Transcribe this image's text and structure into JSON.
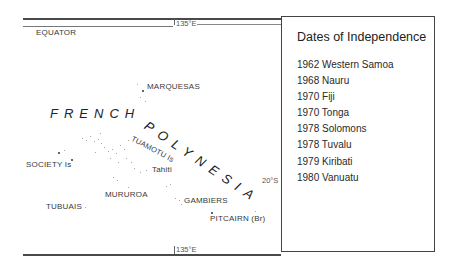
{
  "map": {
    "title": "French Polynesia and Pacific Island Independence",
    "grid_labels": {
      "meridian_top": "135°E",
      "meridian_bottom": "135°E",
      "equator": "EQUATOR",
      "latitude": "20°S"
    },
    "region_labels": {
      "french": "FRENCH",
      "polynesia": "POLYNESIA"
    },
    "place_labels": [
      {
        "name": "MARQUESAS",
        "x": 147,
        "y": 86
      },
      {
        "name": "TUAMOTU Is",
        "x": 134,
        "y": 134,
        "rotate": 28
      },
      {
        "name": "Tahiti",
        "x": 151,
        "y": 168
      },
      {
        "name": "SOCIETY Is",
        "x": 26,
        "y": 158
      },
      {
        "name": "MURUROA",
        "x": 105,
        "y": 191
      },
      {
        "name": "TUBUAIS",
        "x": 46,
        "y": 204
      },
      {
        "name": "GAMBIERS",
        "x": 183,
        "y": 195
      },
      {
        "name": "PITCAIRN (Br)",
        "x": 210,
        "y": 214
      }
    ]
  },
  "legend": {
    "title": "Dates of Independence",
    "entries": [
      {
        "year": "1962",
        "country": "Western Samoa",
        "label": "1962 Western Samoa"
      },
      {
        "year": "1968",
        "country": "Nauru",
        "label": "1968 Nauru"
      },
      {
        "year": "1970",
        "country": "Fiji",
        "label": "1970 Fiji"
      },
      {
        "year": "1970",
        "country": "Tonga",
        "label": "1970 Tonga"
      },
      {
        "year": "1978",
        "country": "Solomons",
        "label": "1978 Solomons"
      },
      {
        "year": "1978",
        "country": "Tuvalu",
        "label": "1978 Tuvalu"
      },
      {
        "year": "1979",
        "country": "Kiribati",
        "label": "1979 Kiribati"
      },
      {
        "year": "1980",
        "country": "Vanuatu",
        "label": "1980 Vanuatu"
      }
    ]
  },
  "colors": {
    "line": "#4a4a4a",
    "text": "#2a2a2a",
    "islands": "#8a8a8a",
    "background": "#ffffff"
  }
}
